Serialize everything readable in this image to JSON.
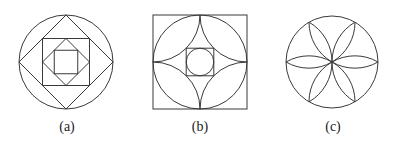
{
  "figures": [
    {
      "id": "a",
      "label": "(a)",
      "description": "Circle with inscribed nested squares alternating orientation (diamond, square, diamond, square)",
      "center": [
        66,
        62
      ],
      "radius": 47
    },
    {
      "id": "b",
      "label": "(b)",
      "description": "Square with inscribed circle, four quarter-circle arcs centered at corners, inner square with inscribed circle",
      "center": [
        200,
        62
      ],
      "half_side": 47
    },
    {
      "id": "c",
      "label": "(c)",
      "description": "Circle with six-petal rosette (hexafoil) formed by circular arcs",
      "center": [
        332,
        62
      ],
      "radius": 46
    }
  ],
  "colors": {
    "line": "#3a3a3a",
    "background": "#ffffff",
    "text": "#222222"
  }
}
